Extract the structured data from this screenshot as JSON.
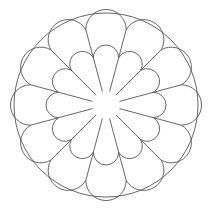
{
  "figure": {
    "title": "",
    "petal_count": 12,
    "stroke_color": "#555555",
    "background": "#ffffff",
    "geometry": {
      "center": [
        106,
        105
      ],
      "outer_circle_radius": 92,
      "radial_line_inner_r": 14,
      "radial_line_outer_r": 78,
      "radial_angle_offset_deg": 15,
      "outer_dome_junction_r": 78,
      "inner_dome_junction_r": 49
    }
  }
}
